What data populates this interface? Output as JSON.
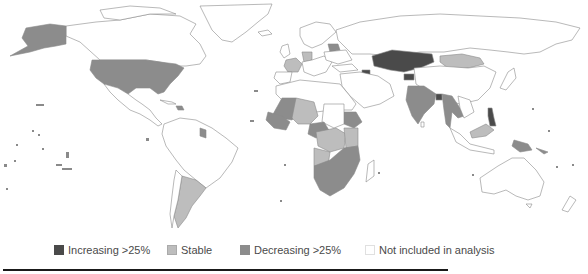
{
  "map": {
    "type": "choropleth world map",
    "categories": {
      "increasing": {
        "label": "Increasing >25%",
        "color": "#4a4a4a"
      },
      "stable": {
        "label": "Stable",
        "color": "#bdbdbd"
      },
      "decreasing": {
        "label": "Decreasing >25%",
        "color": "#8c8c8c"
      },
      "not_included": {
        "label": "Not included in analysis",
        "color": "#ffffff"
      }
    },
    "regions": {
      "increasing": [
        "Kazakhstan",
        "Kyrgyzstan",
        "Azerbaijan",
        "Bangladesh",
        "Philippines (north)"
      ],
      "stable": [
        "Mongolia",
        "France",
        "Czech Republic",
        "Belarus",
        "Argentina",
        "Central Africa",
        "Angola",
        "Tanzania",
        "Malaysia (Borneo)",
        "West Africa (Niger/Nigeria)"
      ],
      "decreasing": [
        "United States",
        "Alaska",
        "India",
        "Myanmar",
        "Thailand",
        "Ethiopia",
        "Mali",
        "Southern Africa",
        "Papua New Guinea",
        "Guyana",
        "Haiti",
        "Germany",
        "Cameroon"
      ]
    }
  },
  "legend": {
    "items": [
      {
        "label": "Increasing >25%",
        "color": "#4a4a4a"
      },
      {
        "label": "Stable",
        "color": "#bdbdbd"
      },
      {
        "label": "Decreasing >25%",
        "color": "#8c8c8c"
      },
      {
        "label": "Not included in analysis",
        "color": "#ffffff"
      }
    ]
  }
}
